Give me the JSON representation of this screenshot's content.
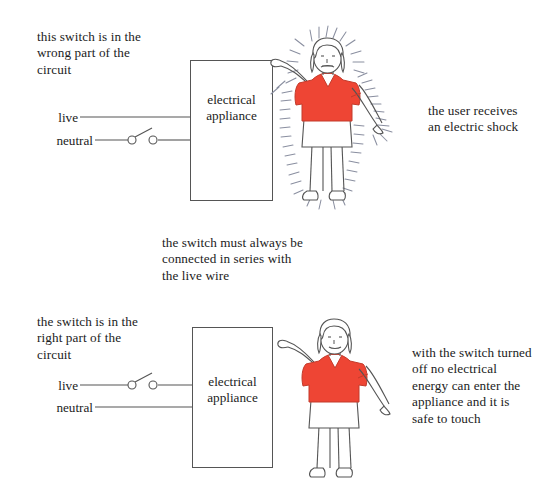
{
  "diagram": {
    "accent_red": "#ee4534",
    "line_color": "#555555",
    "text_color": "#1b1b1b",
    "shock_line_color": "#8a8fa0"
  },
  "top_panel": {
    "caption_left": "this switch is in the\nwrong part of the\ncircuit",
    "appliance_label": "electrical\nappliance",
    "wire_live_label": "live",
    "wire_neutral_label": "neutral",
    "switch_on_wire": "neutral",
    "switch_state": "open",
    "caption_right": "the user receives\nan electric shock",
    "figure": {
      "name": "person-touching-appliance-shocked",
      "shirt_color": "#ee4534",
      "skirt_color": "#ffffff",
      "hair_color": "#ffffff",
      "shock_lines": true
    }
  },
  "middle_note": "the switch must always be\nconnected in series with\nthe live wire",
  "bottom_panel": {
    "caption_left": "the switch is in the\nright part of the\ncircuit",
    "appliance_label": "electrical\nappliance",
    "wire_live_label": "live",
    "wire_neutral_label": "neutral",
    "switch_on_wire": "live",
    "switch_state": "open",
    "caption_right": "with the switch turned\noff no electrical\nenergy can enter the\nappliance and it is\nsafe to touch",
    "figure": {
      "name": "person-touching-appliance-safe",
      "shirt_color": "#ee4534",
      "skirt_color": "#ffffff",
      "hair_color": "#ffffff",
      "shock_lines": false
    }
  }
}
